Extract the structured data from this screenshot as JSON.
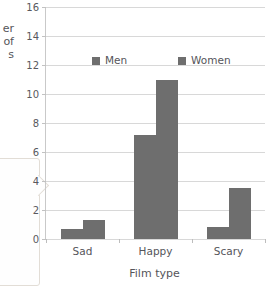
{
  "chart_data": {
    "type": "bar",
    "title": "",
    "categories": [
      "Sad",
      "Happy",
      "Scary"
    ],
    "series": [
      {
        "name": "Men",
        "values": [
          0.7,
          7.2,
          0.8
        ],
        "color": "#6e6e6e"
      },
      {
        "name": "Women",
        "values": [
          1.3,
          11.0,
          3.5
        ],
        "color": "#6e6e6e"
      }
    ],
    "xlabel": "Film type",
    "ylabel": "er\nof\ns",
    "ylabel_note": "multi-line y-axis title cropped at left image edge",
    "ylim": [
      0,
      16
    ],
    "ytick_step": 2,
    "yticks": [
      0,
      2,
      4,
      6,
      8,
      10,
      12,
      14,
      16
    ],
    "ytick_labels": [
      "0",
      "2",
      "4",
      "6",
      "8",
      "10",
      "12",
      "14",
      "16"
    ],
    "grid": true,
    "grid_axis": "y",
    "legend": [
      "Men",
      "Women"
    ],
    "legend_position": "upper center inside plot"
  },
  "axes": {
    "x_title": "Film type",
    "y_title_fragment_line1": "er",
    "y_title_fragment_line2": "of",
    "y_title_fragment_line3": "s"
  },
  "legend": {
    "entries": [
      {
        "label": "Men"
      },
      {
        "label": "Women"
      }
    ]
  },
  "colors": {
    "bar": "#6e6e6e",
    "gridline": "#d8d8d8",
    "axis": "#a9a9a9",
    "text": "#55555a",
    "background": "#ffffff"
  }
}
